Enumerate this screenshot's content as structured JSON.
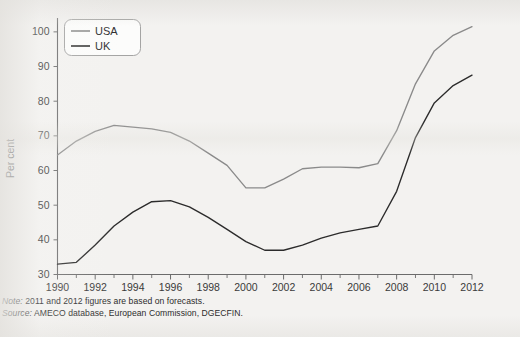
{
  "figure": {
    "background_color": "#f3f2f0",
    "axis_color": "#6b6b6b"
  },
  "axes": {
    "ylabel": "Per cent",
    "y_ticks": [
      "30",
      "40",
      "50",
      "60",
      "70",
      "80",
      "90",
      "100"
    ],
    "x_ticks": [
      "1990",
      "1992",
      "1994",
      "1996",
      "1998",
      "2000",
      "2002",
      "2004",
      "2006",
      "2008",
      "2010",
      "2012"
    ]
  },
  "legend": {
    "position": "top-left-inside",
    "entries": [
      {
        "label": "USA",
        "color": "#8a8a8a"
      },
      {
        "label": "UK",
        "color": "#2b2b2b"
      }
    ]
  },
  "footnotes": {
    "note_lead": "Note:",
    "note_text": " 2011 and 2012 figures are based on forecasts.",
    "source_lead": "Source:",
    "source_text": " AMECO database, European Commission, DGECFIN."
  },
  "chart_data": {
    "type": "line",
    "title": "",
    "xlabel": "",
    "ylabel": "Per cent",
    "xlim": [
      1990,
      2012
    ],
    "ylim": [
      30,
      104
    ],
    "grid": false,
    "legend_position": "upper left",
    "x": [
      1990,
      1991,
      1992,
      1993,
      1994,
      1995,
      1996,
      1997,
      1998,
      1999,
      2000,
      2001,
      2002,
      2003,
      2004,
      2005,
      2006,
      2007,
      2008,
      2009,
      2010,
      2011,
      2012
    ],
    "series": [
      {
        "name": "USA",
        "color": "#8a8a8a",
        "values": [
          64.5,
          68.5,
          71.3,
          73.0,
          72.5,
          72.0,
          71.0,
          68.5,
          65.0,
          61.5,
          55.0,
          55.0,
          57.5,
          60.5,
          61.0,
          61.0,
          60.8,
          62.0,
          71.5,
          85.0,
          94.5,
          99.0,
          101.5
        ]
      },
      {
        "name": "UK",
        "color": "#2b2b2b",
        "values": [
          33.0,
          33.5,
          38.5,
          44.0,
          48.0,
          51.0,
          51.3,
          49.5,
          46.5,
          43.0,
          39.5,
          37.0,
          37.0,
          38.5,
          40.5,
          42.0,
          43.0,
          44.0,
          54.0,
          69.5,
          79.5,
          84.5,
          87.5
        ]
      }
    ],
    "annotations": [
      "2011 and 2012 figures are based on forecasts."
    ]
  }
}
